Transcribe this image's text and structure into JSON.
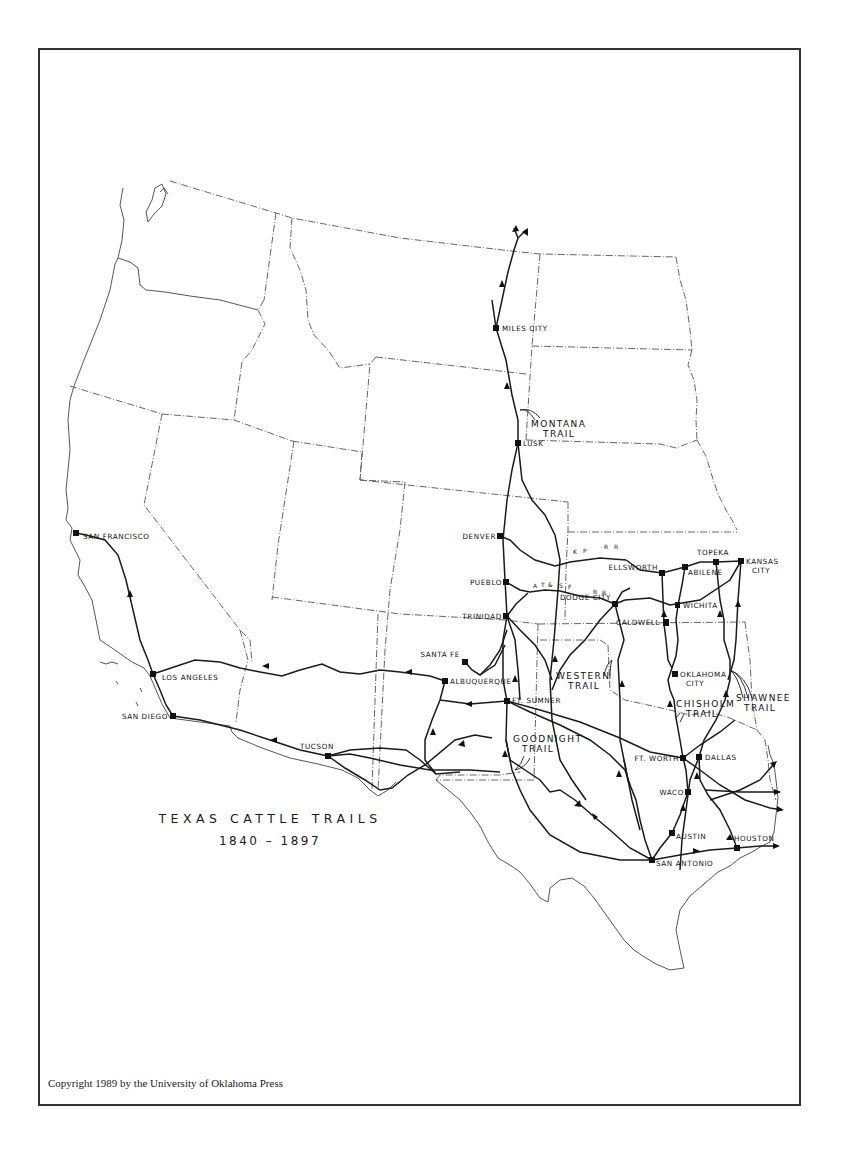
{
  "map": {
    "title": "TEXAS CATTLE TRAILS",
    "dates": "1840 – 1897",
    "copyright": "Copyright 1989 by the University of Oklahoma Press",
    "colors": {
      "ink": "#1a1a1a",
      "frame": "#333333",
      "background": "#ffffff"
    }
  },
  "cities": [
    {
      "name": "MILES CITY",
      "x": 496,
      "y": 328
    },
    {
      "name": "LUSK",
      "x": 518,
      "y": 443
    },
    {
      "name": "DENVER",
      "x": 500,
      "y": 536
    },
    {
      "name": "PUEBLO",
      "x": 506,
      "y": 582
    },
    {
      "name": "TRINIDAD",
      "x": 506,
      "y": 616
    },
    {
      "name": "SANTA FE",
      "x": 465,
      "y": 662
    },
    {
      "name": "ALBUQUERQUE",
      "x": 445,
      "y": 681
    },
    {
      "name": "FT. SUMNER",
      "x": 507,
      "y": 701
    },
    {
      "name": "ELLSWORTH",
      "x": 662,
      "y": 573
    },
    {
      "name": "ABILENE",
      "x": 685,
      "y": 567
    },
    {
      "name": "TOPEKA",
      "x": 716,
      "y": 562
    },
    {
      "name": "KANSAS CITY",
      "x": 741,
      "y": 561
    },
    {
      "name": "DODGE CITY",
      "x": 615,
      "y": 604
    },
    {
      "name": "WICHITA",
      "x": 678,
      "y": 605
    },
    {
      "name": "CALDWELL",
      "x": 667,
      "y": 624
    },
    {
      "name": "OKLAHOMA CITY",
      "x": 675,
      "y": 674
    },
    {
      "name": "FT. WORTH",
      "x": 683,
      "y": 758
    },
    {
      "name": "DALLAS",
      "x": 699,
      "y": 757
    },
    {
      "name": "WACO",
      "x": 688,
      "y": 792
    },
    {
      "name": "AUSTIN",
      "x": 672,
      "y": 833
    },
    {
      "name": "SAN ANTONIO",
      "x": 652,
      "y": 860
    },
    {
      "name": "HOUSTON",
      "x": 737,
      "y": 848
    },
    {
      "name": "SAN FRANCISCO",
      "x": 76,
      "y": 533
    },
    {
      "name": "LOS ANGELES",
      "x": 153,
      "y": 674
    },
    {
      "name": "SAN DIEGO",
      "x": 173,
      "y": 716
    },
    {
      "name": "TUCSON",
      "x": 328,
      "y": 756
    }
  ],
  "trails": [
    {
      "name": "MONTANA TRAIL",
      "label_lines": [
        "MONTANA",
        "TRAIL"
      ]
    },
    {
      "name": "WESTERN TRAIL",
      "label_lines": [
        "WESTERN",
        "TRAIL"
      ]
    },
    {
      "name": "CHISHOLM TRAIL",
      "label_lines": [
        "CHISHOLM",
        "TRAIL"
      ]
    },
    {
      "name": "SHAWNEE TRAIL",
      "label_lines": [
        "SHAWNEE",
        "TRAIL"
      ]
    },
    {
      "name": "GOODNIGHT TRAIL",
      "label_lines": [
        "GOODNIGHT",
        "TRAIL"
      ]
    }
  ],
  "railroads": [
    {
      "name": "K P R R",
      "segments": [
        "K",
        "P",
        "R",
        "R"
      ]
    },
    {
      "name": "A T & S F R R",
      "segments": [
        "A",
        "T",
        "&",
        "S",
        "F",
        "R",
        "R"
      ]
    }
  ]
}
